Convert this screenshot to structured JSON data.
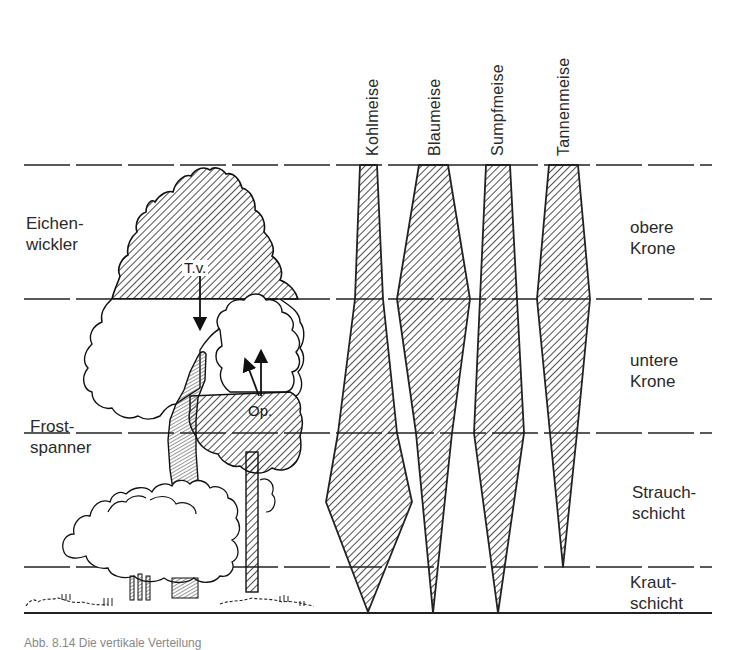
{
  "bird_species": [
    {
      "name": "Kohlmeise",
      "label_x": 381,
      "label_y": 156
    },
    {
      "name": "Blaumeise",
      "label_x": 446,
      "label_y": 156
    },
    {
      "name": "Sumpfmeise",
      "label_x": 508,
      "label_y": 156
    },
    {
      "name": "Tannenmeise",
      "label_x": 575,
      "label_y": 156
    }
  ],
  "layers": [
    {
      "name_line1": "obere",
      "name_line2": "Krone",
      "y_top": 165,
      "y_bottom": 299
    },
    {
      "name_line1": "untere",
      "name_line2": "Krone",
      "y_top": 299,
      "y_bottom": 433
    },
    {
      "name_line1": "Strauch-",
      "name_line2": "schicht",
      "y_top": 433,
      "y_bottom": 567
    },
    {
      "name_line1": "Kraut-",
      "name_line2": "schicht",
      "y_top": 567,
      "y_bottom": 613
    }
  ],
  "pests": [
    {
      "line1": "Eichen-",
      "line2": "wickler"
    },
    {
      "line1": "Frost-",
      "line2": "spanner"
    }
  ],
  "annotations": {
    "tv": "T.v.",
    "op": "Op."
  },
  "distribution_shapes": {
    "Kohlmeise": [
      [
        360,
        165
      ],
      [
        377,
        165
      ],
      [
        383,
        299
      ],
      [
        397,
        433
      ],
      [
        412,
        502
      ],
      [
        368,
        612
      ],
      [
        326,
        502
      ],
      [
        338,
        433
      ],
      [
        355,
        299
      ]
    ],
    "Blaumeise": [
      [
        419,
        165
      ],
      [
        448,
        165
      ],
      [
        470,
        299
      ],
      [
        452,
        433
      ],
      [
        433,
        613
      ],
      [
        416,
        433
      ],
      [
        397,
        299
      ]
    ],
    "Sumpfmeise": [
      [
        486,
        165
      ],
      [
        510,
        165
      ],
      [
        517,
        299
      ],
      [
        524,
        433
      ],
      [
        498,
        613
      ],
      [
        474,
        433
      ],
      [
        480,
        299
      ]
    ],
    "Tannenmeise": [
      [
        549,
        165
      ],
      [
        578,
        165
      ],
      [
        590,
        299
      ],
      [
        577,
        433
      ],
      [
        563,
        567
      ],
      [
        550,
        433
      ],
      [
        537,
        299
      ]
    ]
  },
  "hatch_color": "#222222",
  "line_color": "#222222",
  "caption": "Abb. 8.14 Die vertikale Verteilung"
}
